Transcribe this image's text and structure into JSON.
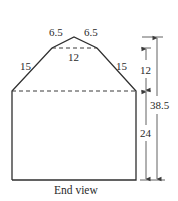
{
  "figure": {
    "caption": "End view",
    "labels": {
      "top_left_segment": "6.5",
      "top_right_segment": "6.5",
      "upper_width": "12",
      "left_slope": "15",
      "right_slope": "15",
      "roof_height": "12",
      "wall_height": "24",
      "total_height": "38.5"
    },
    "colors": {
      "line": "#2f2f2f",
      "background": "#ffffff"
    }
  }
}
